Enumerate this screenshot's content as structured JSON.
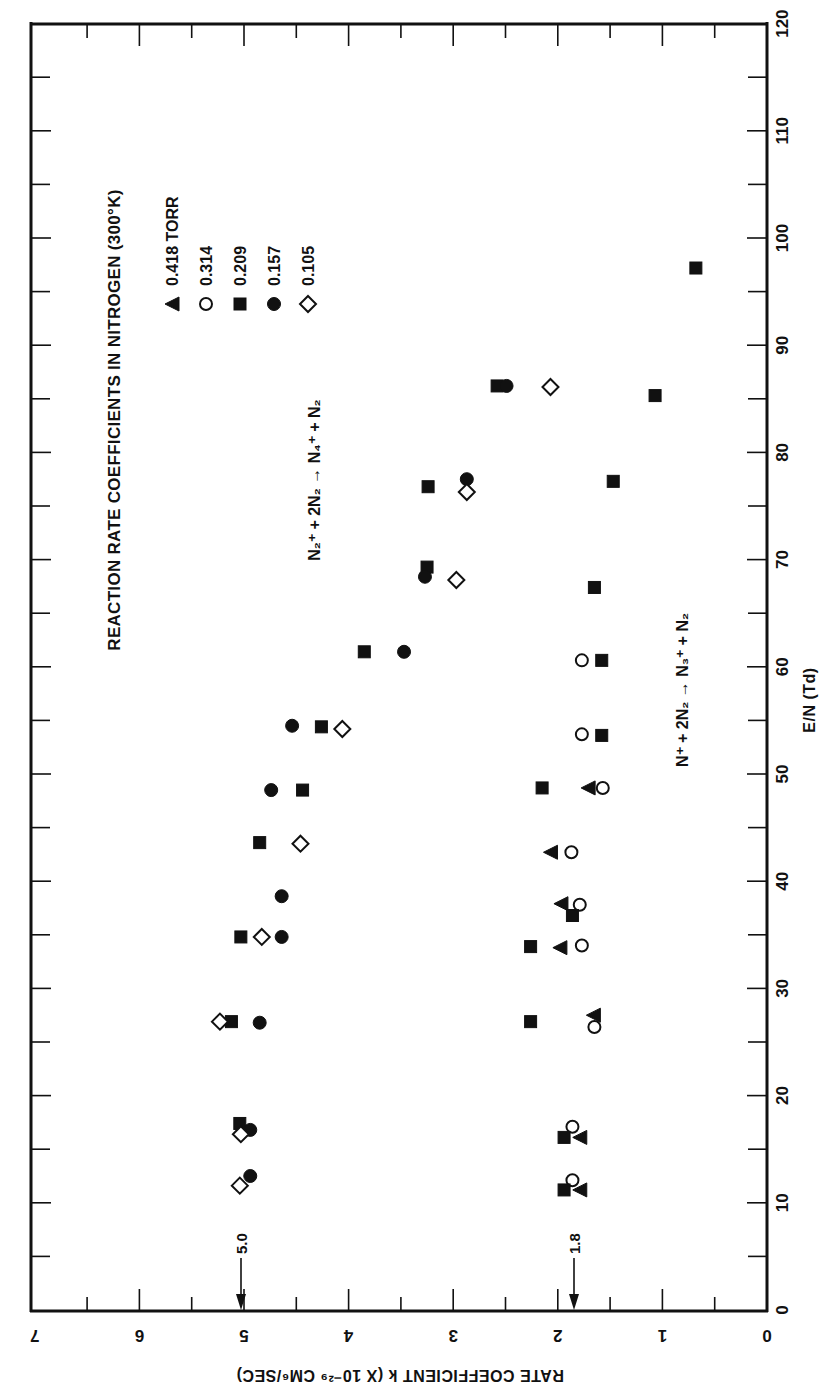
{
  "figure": {
    "title": "REACTION RATE COEFFICIENTS IN NITROGEN (300°K)",
    "x_axis_title": "E/N (Td)",
    "y_axis_title": "RATE COEFFICIENT k (X 10⁻²⁹ CM⁶/SEC)",
    "reaction_upper": "N₂⁺ + 2N₂ → N₄⁺ + N₂",
    "reaction_lower": "N⁺ + 2N₂ → N₃⁺ + N₂",
    "ref_marker_upper": "5.0",
    "ref_marker_lower": "1.8",
    "legend": [
      {
        "symbol": "filled-triangle",
        "label": "0.418 TORR"
      },
      {
        "symbol": "open-circle",
        "label": "0.314"
      },
      {
        "symbol": "filled-square",
        "label": "0.209"
      },
      {
        "symbol": "filled-circle",
        "label": "0.157"
      },
      {
        "symbol": "open-diamond",
        "label": "0.105"
      }
    ]
  },
  "chart_data": {
    "type": "scatter",
    "orientation": "rotated 90deg clockwise (E/N runs bottom-to-top, k runs right-to-left)",
    "title": "REACTION RATE COEFFICIENTS IN NITROGEN (300°K)",
    "xlabel": "E/N (Td)",
    "ylabel": "RATE COEFFICIENT k (X 10^-29 CM^6/SEC)",
    "xlim": [
      0,
      120
    ],
    "ylim": [
      0,
      7
    ],
    "x_ticks": [
      0,
      10,
      20,
      30,
      40,
      50,
      60,
      70,
      80,
      90,
      100,
      110,
      120
    ],
    "y_ticks": [
      0,
      1,
      2,
      3,
      4,
      5,
      6,
      7
    ],
    "grid": false,
    "legend_position": "upper-left inside (rotated)",
    "annotations": [
      {
        "text": "N2+ + 2N2 -> N4+ + N2",
        "group": "upper"
      },
      {
        "text": "N+ + 2N2 -> N3+ + N2",
        "group": "lower"
      },
      {
        "text": "5.0",
        "type": "arrow marker on k axis",
        "value": 5.0
      },
      {
        "text": "1.8",
        "type": "arrow marker on k axis",
        "value": 1.8
      }
    ],
    "series": [
      {
        "name": "0.418 TORR",
        "marker": "filled-triangle",
        "reaction": "N+",
        "points": [
          [
            11.2,
            1.79
          ],
          [
            16.1,
            1.79
          ],
          [
            27.5,
            1.66
          ],
          [
            33.8,
            1.98
          ],
          [
            37.9,
            1.97
          ],
          [
            42.7,
            2.07
          ],
          [
            48.7,
            1.71
          ]
        ]
      },
      {
        "name": "0.314",
        "marker": "open-circle",
        "reaction": "N+",
        "points": [
          [
            12.1,
            1.86
          ],
          [
            17.1,
            1.86
          ],
          [
            26.4,
            1.65
          ],
          [
            34.0,
            1.77
          ],
          [
            37.8,
            1.79
          ],
          [
            42.7,
            1.87
          ],
          [
            48.7,
            1.57
          ],
          [
            53.7,
            1.77
          ],
          [
            60.6,
            1.77
          ]
        ]
      },
      {
        "name": "0.209",
        "marker": "filled-square",
        "reaction": "N2+",
        "points": [
          [
            17.4,
            5.04
          ],
          [
            26.9,
            5.12
          ],
          [
            34.8,
            5.03
          ],
          [
            43.6,
            4.85
          ],
          [
            48.5,
            4.44
          ],
          [
            54.4,
            4.26
          ],
          [
            61.4,
            3.85
          ],
          [
            69.3,
            3.25
          ],
          [
            76.8,
            3.24
          ],
          [
            86.2,
            2.58
          ]
        ]
      },
      {
        "name": "0.209",
        "marker": "filled-square",
        "reaction": "N+",
        "points": [
          [
            11.2,
            1.94
          ],
          [
            16.1,
            1.94
          ],
          [
            26.9,
            2.26
          ],
          [
            33.9,
            2.26
          ],
          [
            36.8,
            1.86
          ],
          [
            48.7,
            2.15
          ],
          [
            53.6,
            1.58
          ],
          [
            60.6,
            1.58
          ],
          [
            67.4,
            1.65
          ],
          [
            77.3,
            1.47
          ],
          [
            85.3,
            1.07
          ],
          [
            97.2,
            0.68
          ]
        ]
      },
      {
        "name": "0.157",
        "marker": "filled-circle",
        "reaction": "N2+",
        "points": [
          [
            12.5,
            4.94
          ],
          [
            16.8,
            4.94
          ],
          [
            26.8,
            4.85
          ],
          [
            34.8,
            4.64
          ],
          [
            38.6,
            4.64
          ],
          [
            48.5,
            4.74
          ],
          [
            54.5,
            4.54
          ],
          [
            61.4,
            3.47
          ],
          [
            68.4,
            3.27
          ],
          [
            77.5,
            2.87
          ],
          [
            86.2,
            2.49
          ]
        ]
      },
      {
        "name": "0.105",
        "marker": "open-diamond",
        "reaction": "N2+",
        "points": [
          [
            11.6,
            5.04
          ],
          [
            16.4,
            5.03
          ],
          [
            26.9,
            5.23
          ],
          [
            34.8,
            4.83
          ],
          [
            43.5,
            4.46
          ],
          [
            54.2,
            4.06
          ],
          [
            68.1,
            2.97
          ],
          [
            76.3,
            2.87
          ],
          [
            86.1,
            2.07
          ]
        ]
      }
    ]
  }
}
